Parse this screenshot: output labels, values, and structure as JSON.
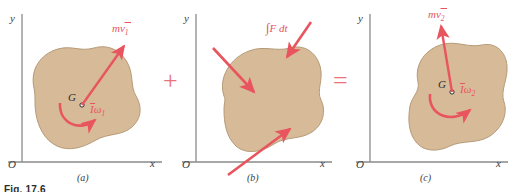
{
  "figure": {
    "title_caption": "Fig. 17.6",
    "background_color": "#ffffff",
    "body_fill_color": "#d7bb99",
    "body_stroke_color": "#b59a77",
    "vector_color": "#e8555e",
    "axis_color": "#8a8a8a",
    "operator_color": "#e8737a",
    "label_text_color": "#2b2b2b"
  },
  "operators": {
    "plus": "+",
    "equals": "="
  },
  "panels": [
    {
      "id": "a",
      "caption": "(a)",
      "meaning": "initial momenta of the rigid body",
      "axes": {
        "x_label": "x",
        "y_label": "y",
        "origin_label": "O"
      },
      "centroid_label": "G",
      "vectors": [
        {
          "name": "linear-momentum-vector",
          "label": "mv̅1",
          "label_plain": "mv̅₁",
          "type": "straight-arrow",
          "direction": "up-right",
          "from": [
            82,
            105
          ],
          "to": [
            124,
            45
          ]
        },
        {
          "name": "angular-momentum-arc",
          "label": "I̅ω1",
          "label_plain": "Īω₁",
          "type": "curved-arrow",
          "sense": "counterclockwise",
          "center": [
            82,
            105
          ]
        }
      ]
    },
    {
      "id": "b",
      "caption": "(b)",
      "meaning": "external impulses acting on the body",
      "axes": {
        "x_label": "x",
        "y_label": "y",
        "origin_label": "O"
      },
      "centroid_label": "",
      "vectors": [
        {
          "name": "impulse-vector-top-right",
          "label": "∫F dt",
          "label_plain": "∫F dt",
          "type": "straight-arrow",
          "direction": "down-left",
          "from": [
            311,
            22
          ],
          "to": [
            286,
            56
          ]
        },
        {
          "name": "impulse-vector-upper-left",
          "label": "",
          "type": "straight-arrow",
          "direction": "down-right",
          "from": [
            216,
            50
          ],
          "to": [
            253,
            90
          ]
        },
        {
          "name": "impulse-vector-lower-left",
          "label": "",
          "type": "straight-arrow",
          "direction": "up-right",
          "from": [
            231,
            172
          ],
          "to": [
            288,
            130
          ]
        }
      ]
    },
    {
      "id": "c",
      "caption": "(c)",
      "meaning": "final momenta of the rigid body",
      "axes": {
        "x_label": "x",
        "y_label": "y",
        "origin_label": "O"
      },
      "centroid_label": "G",
      "vectors": [
        {
          "name": "linear-momentum-vector",
          "label": "mv̅2",
          "label_plain": "mv̅₂",
          "type": "straight-arrow",
          "direction": "up",
          "from": [
            452,
            92
          ],
          "to": [
            442,
            25
          ]
        },
        {
          "name": "angular-momentum-arc",
          "label": "I̅ω2",
          "label_plain": "Īω₂",
          "type": "curved-arrow",
          "sense": "counterclockwise",
          "center": [
            452,
            92
          ]
        }
      ]
    }
  ],
  "labels": {
    "m_v1": "mv",
    "m_v1_sub": "1",
    "I_omega1": "ω",
    "I_omega1_sub": "1",
    "impulse": "F dt",
    "m_v2": "mv",
    "m_v2_sub": "2",
    "I_omega2": "ω",
    "I_omega2_sub": "2"
  }
}
